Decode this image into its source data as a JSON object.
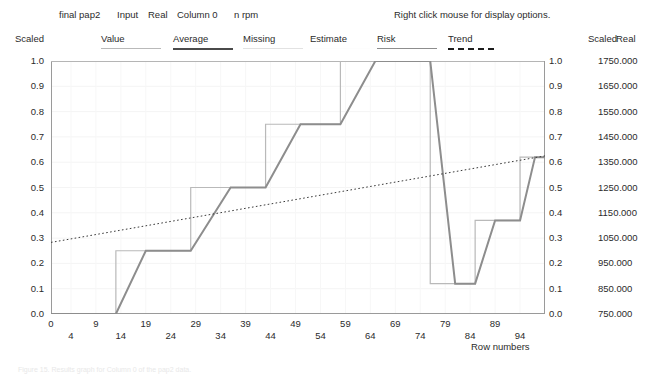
{
  "header": {
    "title": "final pap2",
    "input": "Input",
    "real": "Real",
    "column": "Column 0",
    "unit": "n rpm",
    "hint": "Right click mouse for display options."
  },
  "legend": {
    "scaled_left": "Scaled",
    "scaled_right": "Scaled",
    "real_right": "Real",
    "items": [
      {
        "label": "Value",
        "style": "solid-light",
        "color": "#b9b9b9"
      },
      {
        "label": "Average",
        "style": "solid-dark",
        "color": "#4a4a4a"
      },
      {
        "label": "Missing",
        "style": "solid-faint",
        "color": "#e2e2e2"
      },
      {
        "label": "Estimate",
        "style": "none",
        "color": "#fdfdfd"
      },
      {
        "label": "Risk",
        "style": "solid-mid",
        "color": "#8d8d8d"
      },
      {
        "label": "Trend",
        "style": "dashed",
        "color": "#1d1d1d"
      }
    ]
  },
  "chart_data": {
    "type": "line",
    "title": "final pap2 Input Real Column 0 n rpm",
    "xlabel": "Row numbers",
    "ylabel": "Scaled",
    "ylabel_right": "Real",
    "grid": true,
    "legend_position": "top",
    "xlim": [
      0,
      99
    ],
    "ylim": [
      0.0,
      1.0
    ],
    "y_right_lim": [
      750.0,
      1750.0
    ],
    "y_ticks": [
      "1.0",
      "0.9",
      "0.8",
      "0.7",
      "0.6",
      "0.5",
      "0.4",
      "0.3",
      "0.2",
      "0.1",
      "0.0"
    ],
    "y_tick_values": [
      1.0,
      0.9,
      0.8,
      0.7,
      0.6,
      0.5,
      0.4,
      0.3,
      0.2,
      0.1,
      0.0
    ],
    "y_ticks_right_scaled": [
      "1.0",
      "0.9",
      "0.8",
      "0.7",
      "0.6",
      "0.5",
      "0.4",
      "0.3",
      "0.2",
      "0.1",
      "0.0"
    ],
    "y_ticks_right_real": [
      "1750.000",
      "1650.000",
      "1550.000",
      "1450.000",
      "1350.000",
      "1250.000",
      "1150.000",
      "1050.000",
      "950.000",
      "850.000",
      "750.000"
    ],
    "x_ticks": [
      0,
      4,
      9,
      14,
      19,
      24,
      29,
      34,
      39,
      44,
      49,
      54,
      59,
      64,
      69,
      74,
      79,
      84,
      89,
      94
    ],
    "x_tick_labels": [
      "0",
      "4",
      "9",
      "14",
      "19",
      "24",
      "29",
      "34",
      "39",
      "44",
      "49",
      "54",
      "59",
      "64",
      "69",
      "74",
      "79",
      "84",
      "89",
      "94"
    ],
    "series": [
      {
        "name": "Value",
        "type": "step",
        "color": "#b9b9b9",
        "width": 1.2,
        "points": [
          [
            0,
            0.0
          ],
          [
            13,
            0.0
          ],
          [
            13,
            0.25
          ],
          [
            28,
            0.25
          ],
          [
            28,
            0.5
          ],
          [
            43,
            0.5
          ],
          [
            43,
            0.75
          ],
          [
            58,
            0.75
          ],
          [
            58,
            1.0
          ],
          [
            76,
            1.0
          ],
          [
            76,
            0.12
          ],
          [
            85,
            0.12
          ],
          [
            85,
            0.37
          ],
          [
            94,
            0.37
          ],
          [
            94,
            0.62
          ],
          [
            99,
            0.62
          ]
        ]
      },
      {
        "name": "Risk",
        "type": "line",
        "color": "#8d8d8d",
        "width": 2.0,
        "points": [
          [
            0,
            0.0
          ],
          [
            13,
            0.0
          ],
          [
            19,
            0.25
          ],
          [
            28,
            0.25
          ],
          [
            36,
            0.5
          ],
          [
            43,
            0.5
          ],
          [
            50,
            0.75
          ],
          [
            58,
            0.75
          ],
          [
            65,
            1.0
          ],
          [
            76,
            1.0
          ],
          [
            81,
            0.12
          ],
          [
            85,
            0.12
          ],
          [
            89,
            0.37
          ],
          [
            94,
            0.37
          ],
          [
            97,
            0.62
          ],
          [
            99,
            0.62
          ]
        ]
      },
      {
        "name": "Trend",
        "type": "line",
        "color": "#3a3a3a",
        "width": 1.0,
        "dash": "1.6,2.4",
        "points": [
          [
            0,
            0.283
          ],
          [
            99,
            0.625
          ]
        ]
      }
    ]
  },
  "axis": {
    "row_numbers_label": "Row numbers"
  },
  "caption": "Figure 15. Results graph for Column 0 of the pap2 data."
}
